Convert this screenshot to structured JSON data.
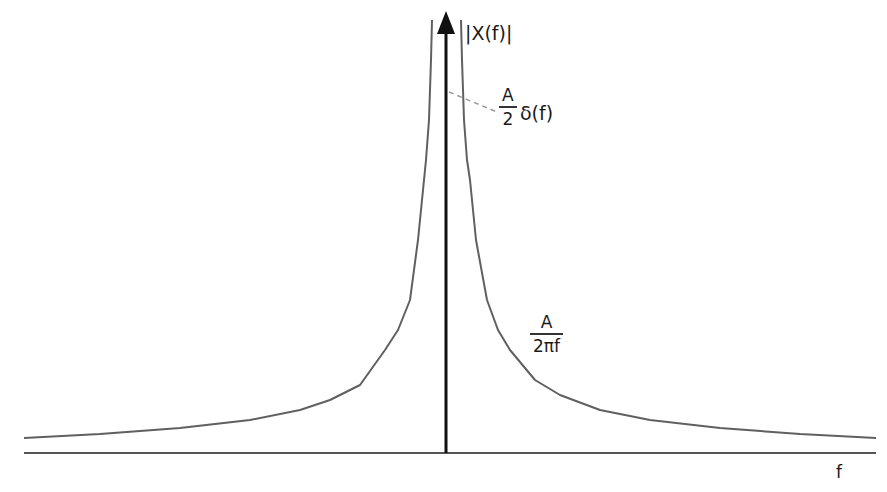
{
  "diagram": {
    "y_axis_label": "|X(f)|",
    "x_axis_label": "f",
    "delta_annotation": {
      "coefficient_numerator": "A",
      "coefficient_denominator": "2",
      "function": "δ(f)"
    },
    "curve_annotation": {
      "numerator": "A",
      "denominator": "2πf"
    },
    "colors": {
      "axis": "#111111",
      "curve": "#555555",
      "leader_line": "#9a9a9a",
      "text": "#1a1a1a"
    }
  }
}
